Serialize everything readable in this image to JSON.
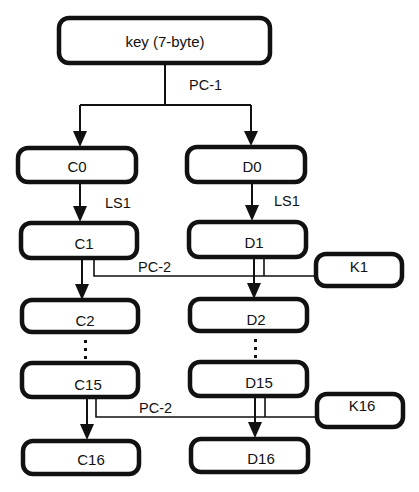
{
  "diagram": {
    "type": "flowchart",
    "nodes": {
      "key": "key (7-byte)",
      "c0": "C0",
      "d0": "D0",
      "c1": "C1",
      "d1": "D1",
      "c2": "C2",
      "d2": "D2",
      "c15": "C15",
      "d15": "D15",
      "c16": "C16",
      "d16": "D16",
      "k1": "K1",
      "k16": "K16"
    },
    "edge_labels": {
      "pc1": "PC-1",
      "ls1_left": "LS1",
      "ls1_right": "LS1",
      "pc2_top": "PC-2",
      "pc2_bottom": "PC-2"
    },
    "ellipsis": "vertical-dots",
    "colors": {
      "stroke": "#111111",
      "background": "#ffffff"
    }
  }
}
